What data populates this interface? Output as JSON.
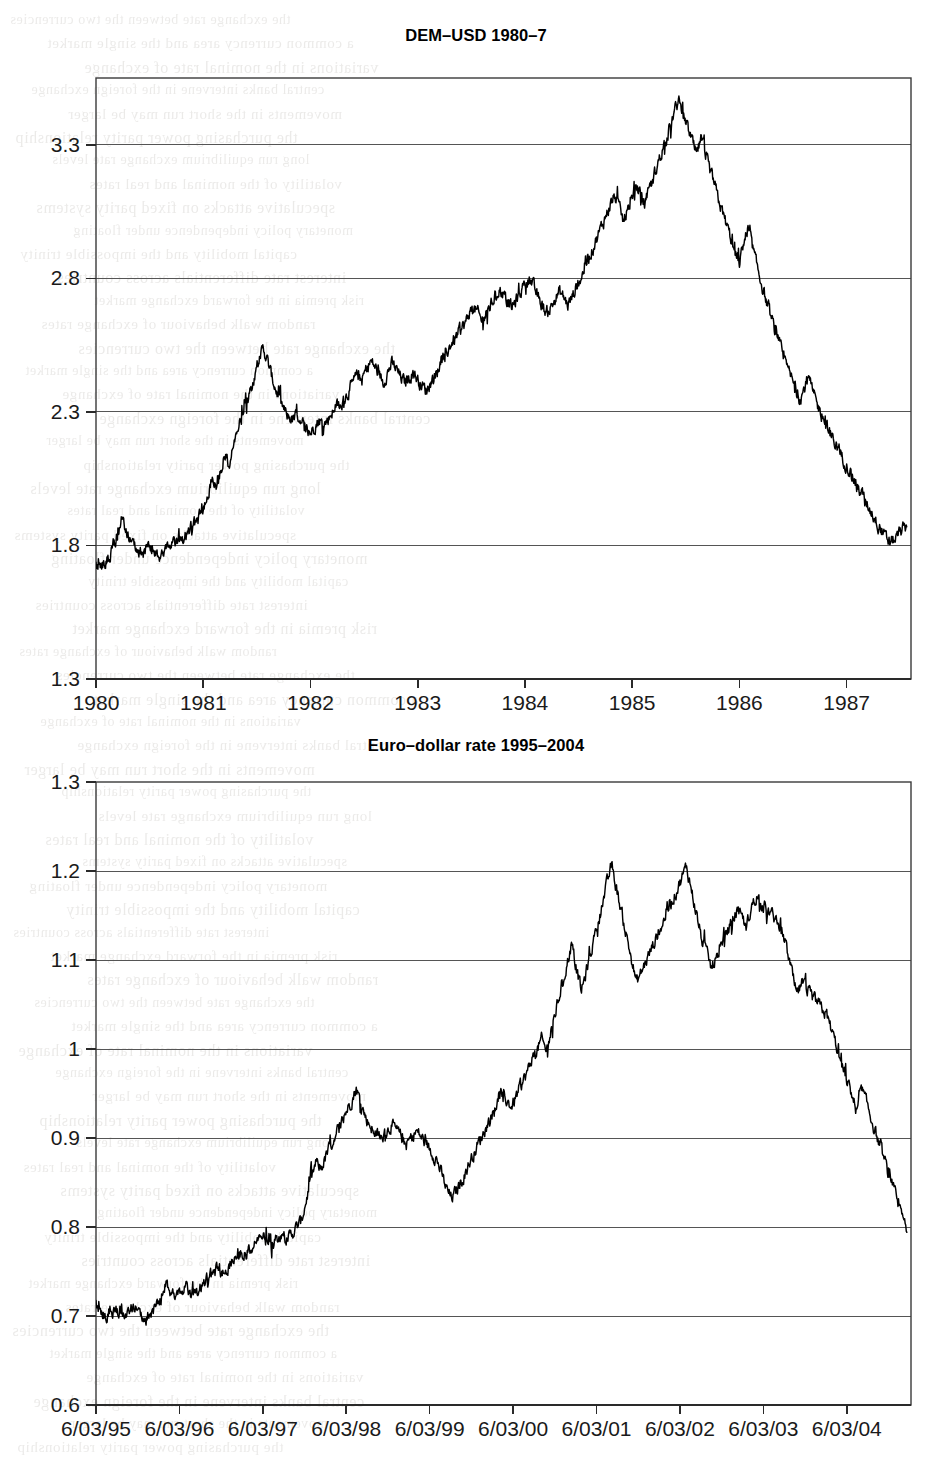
{
  "page": {
    "background_color": "#ffffff",
    "ink_color": "#000000",
    "grid_color": "#555555"
  },
  "bleed_text": {
    "note": "faint mirrored show-through text from the reverse page",
    "lines": [
      "the exchange rate between the two currencies",
      "a common currency area and the single market",
      "variations in the nominal rate of exchange",
      "central banks intervene in the foreign exchange",
      "movements in the short run may be larger",
      "the purchasing power parity relationship",
      "long run equilibrium exchange rate levels",
      "volatility of the nominal and real rates",
      "speculative attacks on fixed parity systems",
      "monetary policy independence under floating",
      "capital mobility and the impossible trinity",
      "interest rate differentials across countries",
      "risk premia in the forward exchange market",
      "random walk behaviour of exchange rates"
    ]
  },
  "charts": [
    {
      "id": "dem-usd",
      "title": "DEM–USD 1980–7",
      "chart_data": {
        "type": "line",
        "title": "DEM–USD 1980–7",
        "xlabel": "",
        "ylabel": "",
        "grid": true,
        "legend": "none",
        "xlim": [
          1980.0,
          1987.6
        ],
        "ylim": [
          1.3,
          3.55
        ],
        "ytick_labels": [
          "1.3",
          "1.8",
          "2.3",
          "2.8",
          "3.3"
        ],
        "ytick_values": [
          1.3,
          1.8,
          2.3,
          2.8,
          3.3
        ],
        "xtick_labels": [
          "1980",
          "1981",
          "1982",
          "1983",
          "1984",
          "1985",
          "1986",
          "1987"
        ],
        "xtick_values": [
          1980,
          1981,
          1982,
          1983,
          1984,
          1985,
          1986,
          1987
        ],
        "series": [
          {
            "name": "DEM per USD",
            "x": [
              1980.0,
              1980.04,
              1980.08,
              1980.12,
              1980.16,
              1980.2,
              1980.24,
              1980.28,
              1980.32,
              1980.36,
              1980.4,
              1980.44,
              1980.48,
              1980.52,
              1980.56,
              1980.6,
              1980.64,
              1980.68,
              1980.72,
              1980.76,
              1980.8,
              1980.84,
              1980.88,
              1980.92,
              1980.96,
              1981.0,
              1981.04,
              1981.08,
              1981.12,
              1981.16,
              1981.2,
              1981.24,
              1981.28,
              1981.32,
              1981.36,
              1981.4,
              1981.44,
              1981.48,
              1981.52,
              1981.56,
              1981.6,
              1981.64,
              1981.68,
              1981.72,
              1981.76,
              1981.8,
              1981.84,
              1981.88,
              1981.92,
              1981.96,
              1982.0,
              1982.04,
              1982.08,
              1982.12,
              1982.16,
              1982.2,
              1982.24,
              1982.28,
              1982.32,
              1982.36,
              1982.4,
              1982.44,
              1982.48,
              1982.52,
              1982.56,
              1982.6,
              1982.64,
              1982.68,
              1982.72,
              1982.76,
              1982.8,
              1982.84,
              1982.88,
              1982.92,
              1982.96,
              1983.0,
              1983.04,
              1983.08,
              1983.12,
              1983.16,
              1983.2,
              1983.24,
              1983.28,
              1983.32,
              1983.36,
              1983.4,
              1983.44,
              1983.48,
              1983.52,
              1983.56,
              1983.6,
              1983.64,
              1983.68,
              1983.72,
              1983.76,
              1983.8,
              1983.84,
              1983.88,
              1983.92,
              1983.96,
              1984.0,
              1984.04,
              1984.08,
              1984.12,
              1984.16,
              1984.2,
              1984.24,
              1984.28,
              1984.32,
              1984.36,
              1984.4,
              1984.44,
              1984.48,
              1984.52,
              1984.56,
              1984.6,
              1984.64,
              1984.68,
              1984.72,
              1984.76,
              1984.8,
              1984.84,
              1984.88,
              1984.92,
              1984.96,
              1985.0,
              1985.04,
              1985.08,
              1985.12,
              1985.16,
              1985.2,
              1985.24,
              1985.28,
              1985.32,
              1985.36,
              1985.4,
              1985.44,
              1985.48,
              1985.52,
              1985.56,
              1985.6,
              1985.64,
              1985.68,
              1985.72,
              1985.76,
              1985.8,
              1985.84,
              1985.88,
              1985.92,
              1985.96,
              1986.0,
              1986.04,
              1986.08,
              1986.12,
              1986.16,
              1986.2,
              1986.24,
              1986.28,
              1986.32,
              1986.36,
              1986.4,
              1986.44,
              1986.48,
              1986.52,
              1986.56,
              1986.6,
              1986.64,
              1986.68,
              1986.72,
              1986.76,
              1986.8,
              1986.84,
              1986.88,
              1986.92,
              1986.96,
              1987.0,
              1987.04,
              1987.08,
              1987.12,
              1987.16,
              1987.2,
              1987.24,
              1987.28,
              1987.32,
              1987.36,
              1987.4,
              1987.44,
              1987.48,
              1987.52,
              1987.56
            ],
            "y": [
              1.72,
              1.73,
              1.74,
              1.76,
              1.78,
              1.84,
              1.92,
              1.86,
              1.81,
              1.8,
              1.78,
              1.77,
              1.79,
              1.78,
              1.76,
              1.76,
              1.77,
              1.79,
              1.8,
              1.81,
              1.82,
              1.84,
              1.86,
              1.88,
              1.9,
              1.93,
              1.99,
              2.05,
              2.02,
              2.08,
              2.14,
              2.1,
              2.17,
              2.23,
              2.28,
              2.34,
              2.38,
              2.44,
              2.5,
              2.54,
              2.49,
              2.43,
              2.38,
              2.34,
              2.3,
              2.28,
              2.27,
              2.29,
              2.26,
              2.24,
              2.22,
              2.25,
              2.27,
              2.25,
              2.27,
              2.3,
              2.33,
              2.31,
              2.35,
              2.38,
              2.41,
              2.44,
              2.42,
              2.46,
              2.49,
              2.47,
              2.44,
              2.41,
              2.45,
              2.48,
              2.46,
              2.43,
              2.41,
              2.43,
              2.45,
              2.42,
              2.4,
              2.38,
              2.41,
              2.44,
              2.47,
              2.5,
              2.53,
              2.56,
              2.58,
              2.61,
              2.63,
              2.66,
              2.69,
              2.67,
              2.64,
              2.67,
              2.7,
              2.73,
              2.76,
              2.74,
              2.71,
              2.69,
              2.72,
              2.75,
              2.78,
              2.8,
              2.77,
              2.73,
              2.7,
              2.67,
              2.69,
              2.72,
              2.75,
              2.73,
              2.7,
              2.73,
              2.77,
              2.8,
              2.84,
              2.88,
              2.92,
              2.96,
              3.0,
              3.04,
              3.08,
              3.11,
              3.06,
              3.01,
              3.06,
              3.1,
              3.14,
              3.12,
              3.08,
              3.13,
              3.18,
              3.23,
              3.28,
              3.33,
              3.38,
              3.43,
              3.47,
              3.42,
              3.36,
              3.31,
              3.26,
              3.32,
              3.27,
              3.21,
              3.16,
              3.1,
              3.05,
              3.0,
              2.95,
              2.9,
              2.86,
              2.93,
              2.99,
              2.92,
              2.85,
              2.79,
              2.73,
              2.67,
              2.62,
              2.57,
              2.52,
              2.47,
              2.43,
              2.39,
              2.35,
              2.38,
              2.43,
              2.38,
              2.33,
              2.3,
              2.26,
              2.22,
              2.19,
              2.16,
              2.13,
              2.1,
              2.07,
              2.04,
              2.01,
              1.98,
              1.95,
              1.92,
              1.89,
              1.86,
              1.83,
              1.81,
              1.82,
              1.84,
              1.86,
              1.87
            ]
          }
        ]
      }
    },
    {
      "id": "euro-dollar",
      "title": "Euro–dollar rate 1995–2004",
      "chart_data": {
        "type": "line",
        "title": "Euro–dollar rate 1995–2004",
        "xlabel": "",
        "ylabel": "",
        "grid": true,
        "legend": "none",
        "xlim": [
          1995.18,
          2004.95
        ],
        "ylim": [
          0.6,
          1.3
        ],
        "ytick_labels": [
          "0.6",
          "0.7",
          "0.8",
          "0.9",
          "1",
          "1.1",
          "1.2",
          "1.3"
        ],
        "ytick_values": [
          0.6,
          0.7,
          0.8,
          0.9,
          1.0,
          1.1,
          1.2,
          1.3
        ],
        "xtick_labels": [
          "6/03/95",
          "6/03/96",
          "6/03/97",
          "6/03/98",
          "6/03/99",
          "6/03/00",
          "6/03/01",
          "6/03/02",
          "6/03/03",
          "6/03/04"
        ],
        "xtick_values": [
          1995.18,
          1996.18,
          1997.18,
          1998.18,
          1999.18,
          2000.18,
          2001.18,
          2002.18,
          2003.18,
          2004.18
        ],
        "series": [
          {
            "name": "USD per EUR",
            "x": [
              1995.18,
              1995.24,
              1995.3,
              1995.36,
              1995.42,
              1995.48,
              1995.54,
              1995.6,
              1995.66,
              1995.72,
              1995.78,
              1995.84,
              1995.9,
              1995.96,
              1996.02,
              1996.08,
              1996.14,
              1996.2,
              1996.26,
              1996.32,
              1996.38,
              1996.44,
              1996.5,
              1996.56,
              1996.62,
              1996.68,
              1996.74,
              1996.8,
              1996.86,
              1996.92,
              1996.98,
              1997.04,
              1997.1,
              1997.16,
              1997.22,
              1997.28,
              1997.34,
              1997.4,
              1997.46,
              1997.52,
              1997.58,
              1997.64,
              1997.7,
              1997.76,
              1997.82,
              1997.88,
              1997.94,
              1998.0,
              1998.06,
              1998.12,
              1998.18,
              1998.24,
              1998.3,
              1998.36,
              1998.42,
              1998.48,
              1998.54,
              1998.6,
              1998.66,
              1998.72,
              1998.78,
              1998.84,
              1998.9,
              1998.96,
              1999.02,
              1999.08,
              1999.14,
              1999.2,
              1999.26,
              1999.32,
              1999.38,
              1999.44,
              1999.5,
              1999.56,
              1999.62,
              1999.68,
              1999.74,
              1999.8,
              1999.86,
              1999.92,
              1999.98,
              2000.04,
              2000.1,
              2000.16,
              2000.22,
              2000.28,
              2000.34,
              2000.4,
              2000.46,
              2000.52,
              2000.58,
              2000.64,
              2000.7,
              2000.76,
              2000.82,
              2000.88,
              2000.94,
              2001.0,
              2001.06,
              2001.12,
              2001.18,
              2001.24,
              2001.3,
              2001.36,
              2001.42,
              2001.48,
              2001.54,
              2001.6,
              2001.66,
              2001.72,
              2001.78,
              2001.84,
              2001.9,
              2001.96,
              2002.02,
              2002.08,
              2002.14,
              2002.2,
              2002.26,
              2002.32,
              2002.38,
              2002.44,
              2002.5,
              2002.56,
              2002.62,
              2002.68,
              2002.74,
              2002.8,
              2002.86,
              2002.92,
              2002.98,
              2003.04,
              2003.1,
              2003.16,
              2003.22,
              2003.28,
              2003.34,
              2003.4,
              2003.46,
              2003.52,
              2003.58,
              2003.64,
              2003.7,
              2003.76,
              2003.82,
              2003.88,
              2003.94,
              2004.0,
              2004.06,
              2004.12,
              2004.18,
              2004.24,
              2004.3,
              2004.36,
              2004.42,
              2004.48,
              2004.54,
              2004.6,
              2004.66,
              2004.72,
              2004.78,
              2004.84,
              2004.9
            ],
            "y": [
              0.712,
              0.706,
              0.7,
              0.711,
              0.697,
              0.709,
              0.703,
              0.712,
              0.706,
              0.7,
              0.697,
              0.703,
              0.709,
              0.716,
              0.735,
              0.727,
              0.719,
              0.724,
              0.73,
              0.721,
              0.727,
              0.733,
              0.739,
              0.745,
              0.751,
              0.746,
              0.753,
              0.76,
              0.767,
              0.773,
              0.769,
              0.776,
              0.783,
              0.79,
              0.786,
              0.78,
              0.787,
              0.793,
              0.786,
              0.792,
              0.799,
              0.806,
              0.83,
              0.855,
              0.872,
              0.866,
              0.88,
              0.893,
              0.905,
              0.918,
              0.93,
              0.942,
              0.956,
              0.938,
              0.921,
              0.913,
              0.905,
              0.898,
              0.906,
              0.915,
              0.908,
              0.901,
              0.893,
              0.9,
              0.908,
              0.901,
              0.893,
              0.885,
              0.877,
              0.86,
              0.843,
              0.832,
              0.84,
              0.852,
              0.864,
              0.877,
              0.889,
              0.901,
              0.913,
              0.925,
              0.938,
              0.95,
              0.943,
              0.935,
              0.947,
              0.96,
              0.972,
              0.985,
              0.997,
              1.01,
              0.998,
              1.022,
              1.046,
              1.07,
              1.093,
              1.118,
              1.09,
              1.065,
              1.088,
              1.112,
              1.135,
              1.159,
              1.183,
              1.207,
              1.18,
              1.154,
              1.127,
              1.101,
              1.074,
              1.087,
              1.1,
              1.113,
              1.126,
              1.139,
              1.152,
              1.165,
              1.178,
              1.192,
              1.205,
              1.178,
              1.151,
              1.124,
              1.107,
              1.09,
              1.103,
              1.117,
              1.13,
              1.143,
              1.156,
              1.147,
              1.138,
              1.16,
              1.172,
              1.165,
              1.158,
              1.151,
              1.144,
              1.137,
              1.112,
              1.086,
              1.06,
              1.073,
              1.066,
              1.059,
              1.052,
              1.045,
              1.038,
              1.02,
              1.002,
              0.984,
              0.966,
              0.948,
              0.93,
              0.955,
              0.938,
              0.92,
              0.902,
              0.884,
              0.866,
              0.848,
              0.83,
              0.812,
              0.794,
              0.8,
              0.824,
              0.848,
              0.838,
              0.828,
              0.845,
              0.835,
              0.825,
              0.848,
              0.838,
              0.828,
              0.818,
              0.808,
              0.798,
              0.78,
              0.758
            ]
          }
        ]
      }
    }
  ]
}
